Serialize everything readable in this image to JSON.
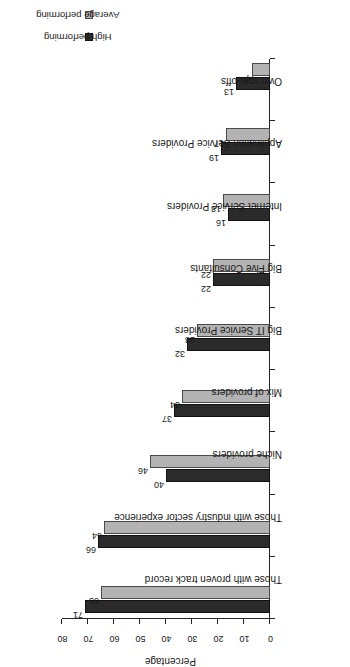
{
  "chart_data": {
    "type": "bar",
    "orientation": "vertical-grouped",
    "title": "",
    "xlabel": "",
    "ylabel": "Percentage",
    "ylim": [
      0,
      80
    ],
    "yticks": [
      0,
      10,
      20,
      30,
      40,
      50,
      60,
      70,
      80
    ],
    "grid": false,
    "legend_position": "top-right",
    "categories": [
      "Those with proven track record",
      "Those with industry sector experience",
      "Niche providers",
      "Mix of providers",
      "Big IT Service Providers",
      "Big Five Consultants",
      "Internet Service Providers",
      "Application Service Providers",
      "Own spin-offs"
    ],
    "series": [
      {
        "name": "High performing",
        "color": "#2b2b2b",
        "values": [
          71,
          66,
          40,
          37,
          32,
          22,
          16,
          19,
          13
        ]
      },
      {
        "name": "Average performing",
        "color": "#b3b3b3",
        "values": [
          65,
          64,
          46,
          34,
          28,
          22,
          18,
          17,
          7
        ]
      }
    ]
  },
  "legend": {
    "items": [
      {
        "label": "High performing",
        "swatch": "high"
      },
      {
        "label": "Average performing",
        "swatch": "avg"
      }
    ]
  },
  "axis": {
    "value_axis_title": "Percentage"
  }
}
